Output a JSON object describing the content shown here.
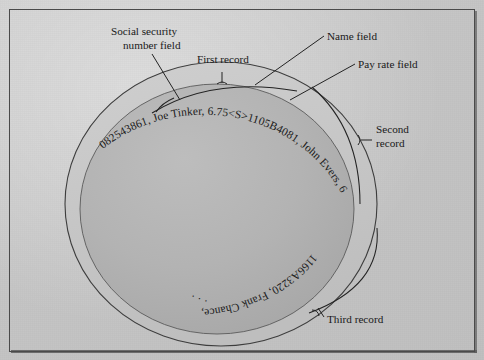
{
  "figure": {
    "background_color": "#c6c6c6",
    "frame_color": "#4a4a4a",
    "disc_fill": "#b0b0b0",
    "ring_fill": "#c4c4c4",
    "ink_color": "#1a1a1a"
  },
  "labels": {
    "ssn_field": {
      "line1": "Social security",
      "line2": "number field"
    },
    "first_record": "First record",
    "name_field": "Name field",
    "pay_rate_field": "Pay rate field",
    "second_record": {
      "line1": "Second",
      "line2": "record"
    },
    "third_record": "Third record"
  },
  "records": [
    {
      "id": "first",
      "text": "082543861, Joe Tinker, 6.75<S>",
      "ssn": "082543861",
      "name": "Joe Tinker",
      "pay_rate": "6.75",
      "separator": "<S>"
    },
    {
      "id": "second",
      "text": "1105B4081, John Evers, 6.00<S>",
      "ssn": "1105B4081",
      "name": "John Evers",
      "pay_rate": "6.00",
      "separator": "<S>"
    },
    {
      "id": "third",
      "text": "1166A3220, Frank Chance, 5.75<S>",
      "ssn": "1166A3220",
      "name": "Frank Chance",
      "pay_rate": "5.75",
      "separator": "<S>"
    }
  ],
  "track": {
    "full_string": "082543861, Joe Tinker, 6.75<S>1105B4081, John Evers, 6.00<S>1166A3220, Frank Chance, 5.75<S>",
    "continuation": "· · ·"
  }
}
